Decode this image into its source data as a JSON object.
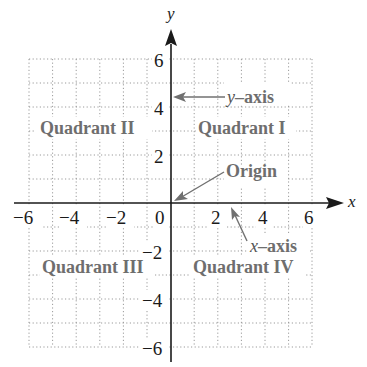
{
  "diagram": {
    "x_axis_label": "x",
    "y_axis_label": "y",
    "x_range": [
      -6,
      6
    ],
    "y_range": [
      -6,
      6
    ],
    "grid_step": 1,
    "x_ticks": [
      "−6",
      "−4",
      "−2",
      "0",
      "2",
      "4",
      "6"
    ],
    "y_ticks": [
      "6",
      "4",
      "2",
      "−2",
      "−4",
      "−6"
    ],
    "quadrants": {
      "q1": "Quadrant I",
      "q2": "Quadrant II",
      "q3": "Quadrant III",
      "q4": "Quadrant IV"
    },
    "annotations": {
      "y_axis_var": "y",
      "y_axis_word": "–axis",
      "x_axis_var": "x",
      "x_axis_word": "–axis",
      "origin": "Origin"
    },
    "colors": {
      "axis": "#1a1a1a",
      "grid": "#9a9a9a",
      "label_gray": "#6e6e6e",
      "arrow_gray": "#707070"
    }
  }
}
